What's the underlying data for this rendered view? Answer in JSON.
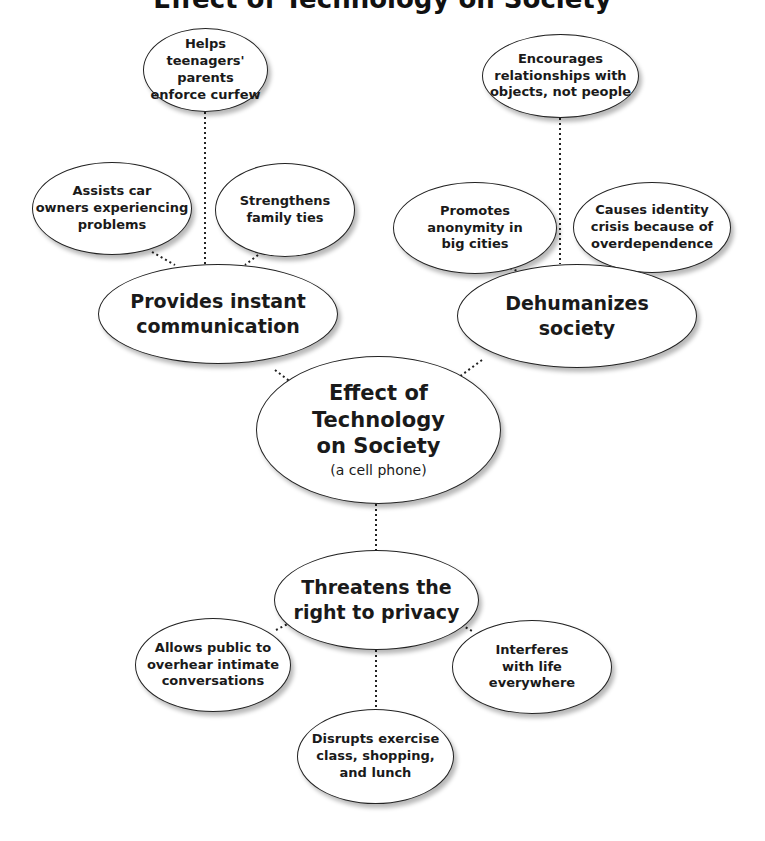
{
  "title": "Effect of Technology on Society",
  "center": {
    "title": "Effect of\nTechnology\non Society",
    "subtitle": "(a cell phone)"
  },
  "branches": [
    {
      "label": "Provides instant\ncommunication",
      "children": [
        "Assists car\nowners experiencing\nproblems",
        "Helps\nteenagers' parents\nenforce curfew",
        "Strengthens\nfamily ties"
      ]
    },
    {
      "label": "Dehumanizes\nsociety",
      "children": [
        "Promotes\nanonymity in\nbig cities",
        "Encourages\nrelationships with\nobjects, not people",
        "Causes identity\ncrisis because of\noverdependence"
      ]
    },
    {
      "label": "Threatens the\nright to privacy",
      "children": [
        "Allows public to\noverhear intimate\nconversations",
        "Disrupts exercise\nclass, shopping,\nand lunch",
        "Interferes\nwith life\neverywhere"
      ]
    }
  ],
  "colors": {
    "stroke": "#222222",
    "fill": "#ffffff",
    "text": "#1a1a1a"
  }
}
